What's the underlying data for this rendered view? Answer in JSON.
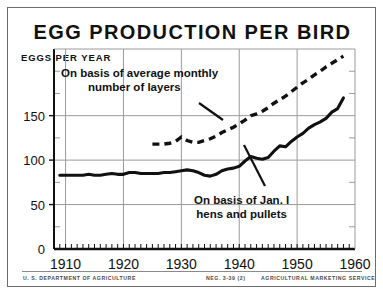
{
  "card": {
    "title": "EGG PRODUCTION PER BIRD",
    "ylabel": "EGGS PER YEAR"
  },
  "annotations": {
    "layers_line1": "On basis of average monthly",
    "layers_line2": "number of layers",
    "jan_line1": "On basis of Jan. I",
    "jan_line2": "hens and pullets"
  },
  "footer": {
    "left": "U. S. DEPARTMENT OF AGRICULTURE",
    "neg": "NEG. 3-39 (2)",
    "right": "AGRICULTURAL MARKETING SERVICE"
  },
  "colors": {
    "ink": "#111111",
    "paper": "#ffffff",
    "grid": "#9a9a9a",
    "border": "#6d6d6d"
  },
  "chart_data": {
    "type": "line",
    "title": "EGG PRODUCTION PER BIRD",
    "xlabel": "",
    "ylabel": "EGGS PER YEAR",
    "xlim": [
      1908,
      1960
    ],
    "ylim": [
      0,
      225
    ],
    "xticks": [
      1910,
      1920,
      1930,
      1940,
      1950,
      1960
    ],
    "xtick_labels": [
      "1910",
      "1920",
      "1930",
      "1940",
      "1950",
      "1960"
    ],
    "yticks": [
      0,
      50,
      100,
      150
    ],
    "ytick_labels": [
      "0",
      "50",
      "100",
      "150"
    ],
    "yminor_ticks": [
      25,
      75,
      125,
      175,
      200
    ],
    "grid": true,
    "grid_axis": "both",
    "legend": "annotations",
    "series": [
      {
        "name": "On basis of Jan. I hens and pullets",
        "style": "solid",
        "x": [
          1909,
          1910,
          1911,
          1912,
          1913,
          1914,
          1915,
          1916,
          1917,
          1918,
          1919,
          1920,
          1921,
          1922,
          1923,
          1924,
          1925,
          1926,
          1927,
          1928,
          1929,
          1930,
          1931,
          1932,
          1933,
          1934,
          1935,
          1936,
          1937,
          1938,
          1939,
          1940,
          1941,
          1942,
          1943,
          1944,
          1945,
          1946,
          1947,
          1948,
          1949,
          1950,
          1951,
          1952,
          1953,
          1954,
          1955,
          1956,
          1957,
          1958
        ],
        "values": [
          83,
          83,
          83,
          83,
          83,
          84,
          83,
          83,
          84,
          85,
          84,
          84,
          86,
          86,
          85,
          85,
          85,
          85,
          86,
          86,
          87,
          88,
          89,
          88,
          86,
          83,
          82,
          84,
          88,
          90,
          91,
          93,
          99,
          104,
          102,
          101,
          103,
          110,
          116,
          115,
          121,
          126,
          130,
          136,
          140,
          143,
          147,
          154,
          158,
          170
        ]
      },
      {
        "name": "On basis of average monthly number of layers",
        "style": "dashed",
        "x": [
          1925,
          1926,
          1927,
          1928,
          1929,
          1930,
          1931,
          1932,
          1933,
          1934,
          1935,
          1936,
          1937,
          1938,
          1939,
          1940,
          1941,
          1942,
          1943,
          1944,
          1945,
          1946,
          1947,
          1948,
          1949,
          1950,
          1951,
          1952,
          1953,
          1954,
          1955,
          1956,
          1957,
          1958
        ],
        "values": [
          118,
          118,
          118,
          119,
          121,
          126,
          122,
          120,
          120,
          122,
          124,
          127,
          131,
          134,
          137,
          141,
          145,
          150,
          152,
          155,
          159,
          164,
          168,
          172,
          177,
          182,
          187,
          191,
          196,
          200,
          205,
          209,
          213,
          217
        ]
      }
    ]
  }
}
